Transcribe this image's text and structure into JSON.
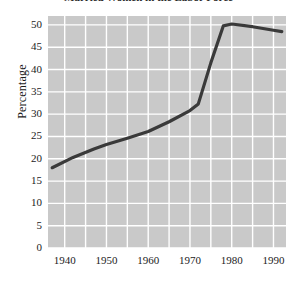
{
  "chart_data": {
    "type": "line",
    "title": "",
    "title_truncated": true,
    "xlabel": "",
    "ylabel": "Percentage",
    "xlim": [
      1936,
      1993
    ],
    "ylim": [
      0,
      52
    ],
    "grid": true,
    "legend": false,
    "y_ticks": [
      50,
      45,
      40,
      35,
      30,
      25,
      20,
      15,
      10,
      5,
      0
    ],
    "x_ticks": [
      1940,
      1950,
      1960,
      1970,
      1980,
      1990
    ],
    "x_minor_step": 5,
    "series": [
      {
        "name": "Percentage",
        "color": "#3a3a3a",
        "x": [
          1937,
          1942,
          1947,
          1950,
          1955,
          1960,
          1965,
          1970,
          1972,
          1975,
          1978,
          1980,
          1985,
          1990,
          1992
        ],
        "values": [
          18.0,
          20.3,
          22.2,
          23.2,
          24.6,
          26.1,
          28.3,
          30.8,
          32.3,
          41.5,
          49.8,
          50.2,
          49.6,
          48.8,
          48.5
        ]
      }
    ],
    "colors": {
      "plot_background": "#c9c9c9",
      "gridline": "#ffffff",
      "line": "#3a3a3a",
      "text": "#1b1b1b",
      "page_background": "#ffffff"
    }
  },
  "axis": {
    "y_title": "Percentage",
    "y_tick_labels": [
      "50",
      "45",
      "40",
      "35",
      "30",
      "25",
      "20",
      "15",
      "10",
      "5",
      "0"
    ],
    "x_tick_labels": [
      "1940",
      "1950",
      "1960",
      "1970",
      "1980",
      "1990"
    ]
  },
  "header": {
    "title_fragment": "Married Women in the Labor Force"
  }
}
